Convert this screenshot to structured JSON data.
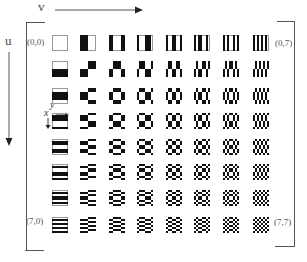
{
  "figure": {
    "type": "basis-function-matrix",
    "rows": 8,
    "cols": 8,
    "axis_labels": {
      "horizontal": "v",
      "vertical": "u",
      "inner_horizontal": "y",
      "inner_vertical": "x"
    },
    "corner_labels": {
      "top_left": "(0,0)",
      "top_right": "(0,7)",
      "bottom_left": "(7,0)",
      "bottom_right": "(7,7)"
    },
    "colors": {
      "pattern_dark": "#111111",
      "background": "#ffffff",
      "lines": "#555555"
    }
  }
}
